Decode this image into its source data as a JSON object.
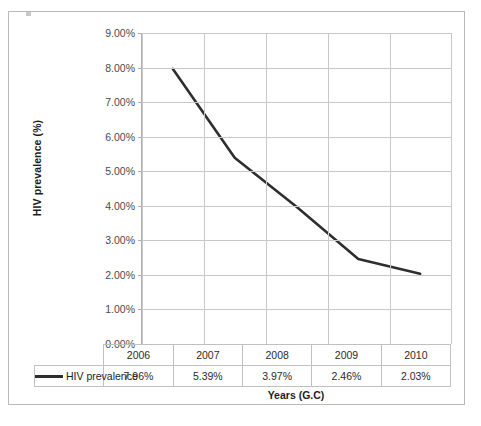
{
  "chart_data": {
    "type": "line",
    "title": "",
    "xlabel": "Years (G.C)",
    "ylabel": "HIV prevalence (%)",
    "categories": [
      "2006",
      "2007",
      "2008",
      "2009",
      "2010"
    ],
    "series": [
      {
        "name": "HIV prevalence",
        "values": [
          7.96,
          5.39,
          3.97,
          2.46,
          2.03
        ],
        "value_labels": [
          "7.96%",
          "5.39%",
          "3.97%",
          "2.46%",
          "2.03%"
        ],
        "color": "#2e2e2e"
      }
    ],
    "ylim": [
      0,
      9
    ],
    "ytick_values": [
      0,
      1,
      2,
      3,
      4,
      5,
      6,
      7,
      8,
      9
    ],
    "ytick_labels": [
      "0.00%",
      "1.00%",
      "2.00%",
      "3.00%",
      "4.00%",
      "5.00%",
      "6.00%",
      "7.00%",
      "8.00%",
      "9.00%"
    ],
    "grid": true,
    "legend_position": "data-table-row",
    "data_table": {
      "visible": true,
      "header_row": [
        "",
        "2006",
        "2007",
        "2008",
        "2009",
        "2010"
      ],
      "rows": [
        {
          "label": "HIV prevalence",
          "cells": [
            "7.96%",
            "5.39%",
            "3.97%",
            "2.46%",
            "2.03%"
          ]
        }
      ]
    }
  },
  "colors": {
    "series_line": "#2e2e2e",
    "gridline": "#c8c8c8",
    "axis_line": "#b0b0b0",
    "frame_border": "#b9b9b9",
    "tick_text": "#4a4a4a",
    "title_text": "#1d1d1d",
    "background": "#ffffff"
  }
}
